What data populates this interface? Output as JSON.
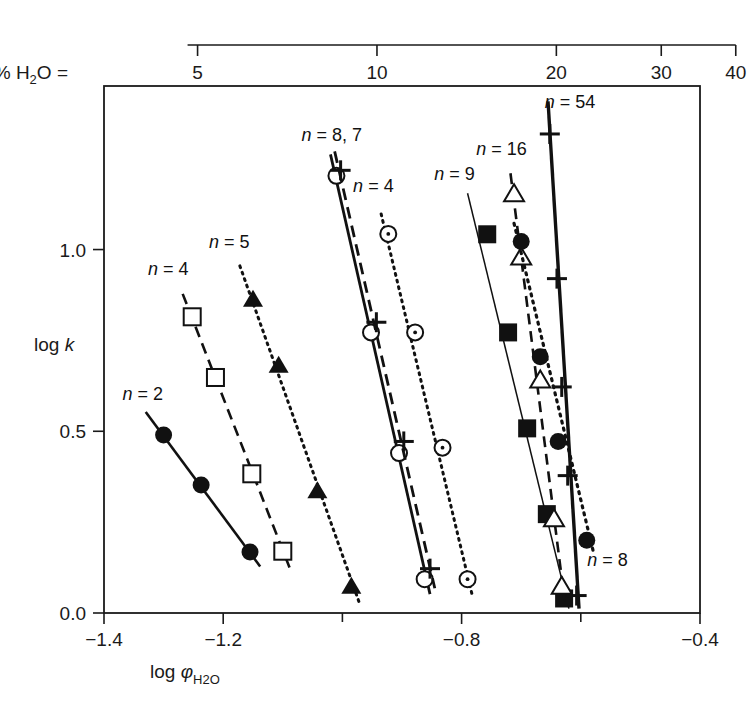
{
  "chart_data": {
    "type": "scatter",
    "title": "",
    "xlabel": "log φH2O",
    "ylabel": "log k",
    "xlim": [
      -1.4,
      -0.4
    ],
    "ylim": [
      0.0,
      1.45
    ],
    "grid": false,
    "legend": "inline-annotations",
    "x_ticks": [
      -1.4,
      -1.2,
      -1.0,
      -0.8,
      -0.6,
      -0.4
    ],
    "x_tick_labels": [
      "−1.4",
      "−1.2",
      "",
      "−0.8",
      "",
      "−0.4"
    ],
    "y_ticks": [
      0.0,
      0.5,
      1.0
    ],
    "y_tick_labels": [
      "0.0",
      "0.5",
      "1.0"
    ],
    "secondary_axis": {
      "label": "% H2O =",
      "position": "top",
      "scale": "log",
      "ticks": [
        5,
        10,
        20,
        30,
        40
      ],
      "tick_labels": [
        "5",
        "10",
        "20",
        "30",
        "40"
      ],
      "tick_x_log_phi": [
        -1.243,
        -0.942,
        -0.641,
        -0.465,
        -0.34
      ]
    },
    "series": [
      {
        "name": "n = 2",
        "label": "n = 2",
        "label_x": -1.335,
        "label_y": 0.585,
        "line": "solid",
        "width": 2.6,
        "marker": "filled-circle",
        "points": [
          [
            -1.3,
            0.49
          ],
          [
            -1.237,
            0.352
          ],
          [
            -1.155,
            0.168
          ]
        ],
        "line_from": [
          -1.33,
          0.553
        ],
        "line_to": [
          -1.138,
          0.128
        ]
      },
      {
        "name": "n = 4 (left, open squares)",
        "label": "n = 4",
        "label_x": -1.292,
        "label_y": 0.93,
        "line": "dashed",
        "width": 2.6,
        "marker": "open-square",
        "points": [
          [
            -1.252,
            0.815
          ],
          [
            -1.213,
            0.648
          ],
          [
            -1.152,
            0.383
          ],
          [
            -1.1,
            0.17
          ]
        ],
        "line_from": [
          -1.268,
          0.878
        ],
        "line_to": [
          -1.088,
          0.122
        ]
      },
      {
        "name": "n = 5",
        "label": "n = 5",
        "label_x": -1.19,
        "label_y": 1.005,
        "line": "dotted",
        "width": 3.0,
        "marker": "filled-triangle",
        "points": [
          [
            -1.15,
            0.862
          ],
          [
            -1.107,
            0.68
          ],
          [
            -1.042,
            0.335
          ],
          [
            -0.985,
            0.072
          ]
        ],
        "line_from": [
          -1.172,
          0.955
        ],
        "line_to": [
          -0.972,
          0.03
        ]
      },
      {
        "name": "n = 8, 7 (solid, open circles)",
        "label": "n = 8, 7",
        "label_x": -1.018,
        "label_y": 1.3,
        "line": "solid",
        "width": 2.8,
        "marker": "open-circle",
        "points": [
          [
            -1.01,
            1.203
          ],
          [
            -0.952,
            0.772
          ],
          [
            -0.905,
            0.44
          ],
          [
            -0.862,
            0.093
          ]
        ],
        "line_from": [
          -1.02,
          1.262
        ],
        "line_to": [
          -0.853,
          0.052
        ]
      },
      {
        "name": "n = 8, 7 (dashed, plus)",
        "label": "",
        "line": "dashed",
        "width": 2.8,
        "marker": "plus",
        "points": [
          [
            -1.003,
            1.218
          ],
          [
            -0.943,
            0.8
          ],
          [
            -0.897,
            0.472
          ],
          [
            -0.853,
            0.122
          ]
        ],
        "line_from": [
          -1.013,
          1.27
        ],
        "line_to": [
          -0.845,
          0.068
        ]
      },
      {
        "name": "n = 4 (middle, dotted, dotted-circle)",
        "label": "n = 4",
        "label_x": -0.948,
        "label_y": 1.158,
        "line": "dotted",
        "width": 3.0,
        "marker": "dotted-circle",
        "points": [
          [
            -0.923,
            1.043
          ],
          [
            -0.878,
            0.772
          ],
          [
            -0.832,
            0.455
          ],
          [
            -0.79,
            0.093
          ]
        ],
        "line_from": [
          -0.935,
          1.098
        ],
        "line_to": [
          -0.782,
          0.048
        ]
      },
      {
        "name": "n = 9",
        "label": "n = 9",
        "label_x": -0.812,
        "label_y": 1.192,
        "line": "solid-thin",
        "width": 1.5,
        "marker": "filled-square",
        "points": [
          [
            -0.757,
            1.042
          ],
          [
            -0.722,
            0.772
          ],
          [
            -0.69,
            0.508
          ],
          [
            -0.657,
            0.272
          ],
          [
            -0.628,
            0.04
          ]
        ],
        "line_from": [
          -0.79,
          1.155
        ],
        "line_to": [
          -0.62,
          0.012
        ]
      },
      {
        "name": "n = 16",
        "label": "n = 16",
        "label_x": -0.733,
        "label_y": 1.26,
        "line": "dashed",
        "width": 2.6,
        "marker": "open-triangle",
        "points": [
          [
            -0.712,
            1.152
          ],
          [
            -0.7,
            0.978
          ],
          [
            -0.668,
            0.64
          ],
          [
            -0.645,
            0.258
          ],
          [
            -0.632,
            0.072
          ]
        ],
        "line_from": [
          -0.718,
          1.21
        ],
        "line_to": [
          -0.627,
          0.032
        ]
      },
      {
        "name": "n = 8 (right, dotted, filled circles)",
        "label": "n = 8",
        "label_x": -0.555,
        "label_y": 0.128,
        "line": "dotted",
        "width": 3.2,
        "marker": "filled-circle",
        "points": [
          [
            -0.7,
            1.022
          ],
          [
            -0.668,
            0.705
          ],
          [
            -0.638,
            0.472
          ],
          [
            -0.59,
            0.2
          ]
        ],
        "line_from": [
          -0.712,
          1.072
        ],
        "line_to": [
          -0.578,
          0.162
        ]
      },
      {
        "name": "n = 54",
        "label": "n = 54",
        "label_x": -0.618,
        "label_y": 1.39,
        "line": "solid",
        "width": 3.4,
        "marker": "plus",
        "points": [
          [
            -0.652,
            1.318
          ],
          [
            -0.64,
            0.92
          ],
          [
            -0.632,
            0.622
          ],
          [
            -0.622,
            0.378
          ],
          [
            -0.607,
            0.048
          ]
        ],
        "line_from": [
          -0.655,
          1.408
        ],
        "line_to": [
          -0.603,
          0.012
        ]
      }
    ]
  },
  "axes": {
    "y_title": "log k",
    "x_title_prefix": "log ",
    "x_title_phi": "φ",
    "x_title_sub": "H",
    "x_title_sub2": "2",
    "x_title_sub3": "O",
    "top_title_prefix": "% H",
    "top_title_sub": "2",
    "top_title_suffix": "O ="
  }
}
